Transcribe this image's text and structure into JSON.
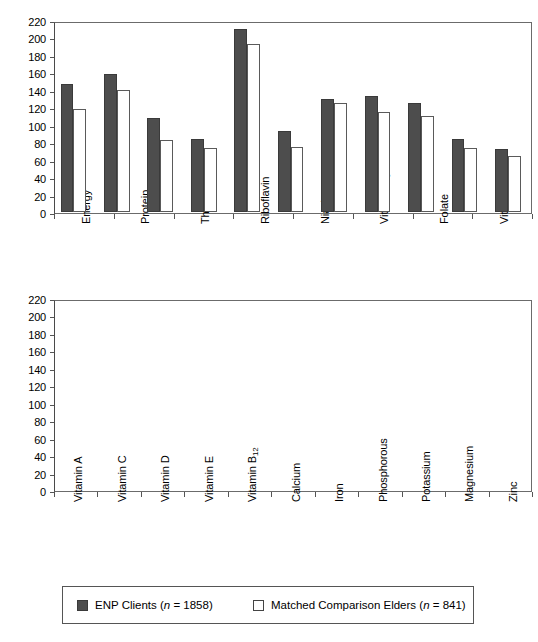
{
  "chart_data": [
    {
      "id": "top",
      "type": "bar",
      "title": "",
      "xlabel": "",
      "ylabel": "",
      "ylim": [
        0,
        220
      ],
      "ytick_step": 20,
      "yticks": [
        0,
        20,
        40,
        60,
        80,
        100,
        120,
        140,
        160,
        180,
        200,
        220
      ],
      "grid": false,
      "legend_position": "bottom",
      "categories": [
        "Energy",
        "Protein",
        "Thiamin",
        "Riboflavin",
        "Niacin",
        "Vitamin B6",
        "Folate",
        "Vitamin B12"
      ],
      "categories_display": [
        "Energy",
        "Protein",
        "Thiamin",
        "Riboflavin",
        "Niacin",
        "Vitamin B<sub>6</sub>",
        "Folate",
        "Vitamin B<sub>12</sub>"
      ],
      "series": [
        {
          "name": "ENP Clients (n = 1858)",
          "key": "enp",
          "color": "#4d4d4d",
          "values": [
            75,
            116,
            135,
            140,
            132,
            94,
            136,
            206
          ]
        },
        {
          "name": "Matched Comparison Elders (n = 841)",
          "key": "mce",
          "color": "#ffffff",
          "values": [
            68,
            109,
            127,
            120,
            123,
            85,
            123,
            190
          ]
        }
      ]
    },
    {
      "id": "bottom",
      "type": "bar",
      "title": "",
      "xlabel": "",
      "ylabel": "",
      "ylim": [
        0,
        220
      ],
      "ytick_step": 20,
      "yticks": [
        0,
        20,
        40,
        60,
        80,
        100,
        120,
        140,
        160,
        180,
        200,
        220
      ],
      "grid": false,
      "legend_position": "bottom",
      "categories": [
        "Vitamin A",
        "Vitamin C",
        "Vitamin D",
        "Vitamin E",
        "Vitamin B12",
        "Calcium",
        "Iron",
        "Phosphorous",
        "Potassium",
        "Magnesium",
        "Zinc"
      ],
      "categories_display": [
        "Vitamin A",
        "Vitamin C",
        "Vitamin D",
        "Vitamin E",
        "Vitamin B<sub>12</sub>",
        "Calcium",
        "Iron",
        "Phosphorous",
        "Potassium",
        "Magnesium",
        "Zinc"
      ],
      "series": [
        {
          "name": "ENP Clients (n = 1858)",
          "key": "enp",
          "color": "#4d4d4d",
          "values": [
            147,
            158,
            108,
            84,
            210,
            93,
            129,
            133,
            125,
            84,
            72
          ]
        },
        {
          "name": "Matched Comparison Elders (n = 841)",
          "key": "mce",
          "color": "#ffffff",
          "values": [
            118,
            140,
            83,
            73,
            192,
            74,
            125,
            115,
            110,
            73,
            64
          ]
        }
      ]
    }
  ],
  "legend": {
    "entries": [
      {
        "label_prefix": "ENP Clients (",
        "label_italic": "n",
        "label_suffix": " = 1858)",
        "swatch": "dark"
      },
      {
        "label_prefix": "Matched Comparison Elders  (",
        "label_italic": "n",
        "label_suffix": " = 841)",
        "swatch": "light"
      }
    ]
  },
  "colors": {
    "enp_bar": "#4d4d4d",
    "mce_bar": "#ffffff",
    "axis": "#555555",
    "frame": "#6b6b6b",
    "background": "#ffffff"
  }
}
